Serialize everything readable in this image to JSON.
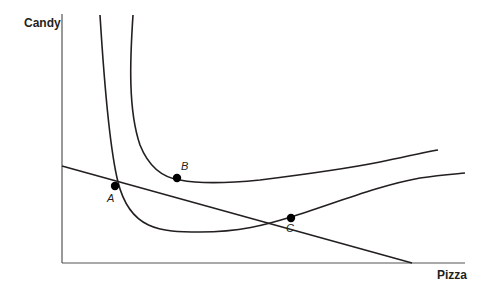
{
  "axes": {
    "y_label": "Candy",
    "x_label": "Pizza"
  },
  "points": [
    {
      "id": "A",
      "label": "A"
    },
    {
      "id": "B",
      "label": "B"
    },
    {
      "id": "C",
      "label": "C"
    }
  ],
  "elements": {
    "budget_line": "straight downward-sloping budget line",
    "indifference_curve_1": "lower curve through A and C",
    "indifference_curve_2": "higher curve tangent at B"
  },
  "colors": {
    "line": "#231f20",
    "axis": "#555555",
    "background": "#ffffff"
  }
}
